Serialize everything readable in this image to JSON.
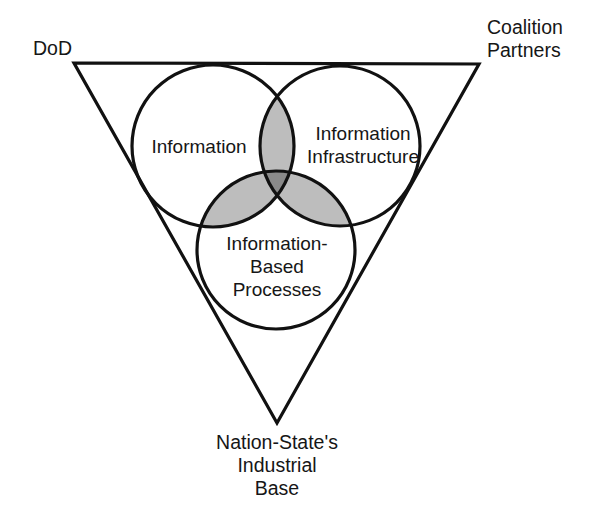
{
  "diagram": {
    "type": "venn-in-triangle",
    "title": "",
    "corners": {
      "top_left": "DoD",
      "top_right_line1": "Coalition",
      "top_right_line2": "Partners",
      "bottom_line1": "Nation-State's",
      "bottom_line2": "Industrial",
      "bottom_line3": "Base"
    },
    "circles": {
      "left_label": "Information",
      "right_label_line1": "Information",
      "right_label_line2": "Infrastructure",
      "bottom_label_line1": "Information-",
      "bottom_label_line2": "Based",
      "bottom_label_line3": "Processes"
    },
    "colors": {
      "stroke": "#111111",
      "background": "#ffffff",
      "pair_overlap_fill": "#bdbdbd",
      "triple_overlap_fill": "#8a8a8a",
      "text": "#161616"
    }
  }
}
